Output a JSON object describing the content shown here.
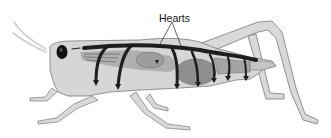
{
  "figure": {
    "labels": [
      {
        "id": "hearts",
        "text": "Hearts",
        "x": 159,
        "y": 13
      }
    ]
  },
  "colors": {
    "background": "#ffffff",
    "body_fill": "#d6d6d6",
    "body_outline": "#7a7a7a",
    "heart_vessel": "#1e1e1e",
    "organs": "#9a9a9a",
    "organs_dark": "#6e6e6e",
    "label_text": "#111111"
  }
}
